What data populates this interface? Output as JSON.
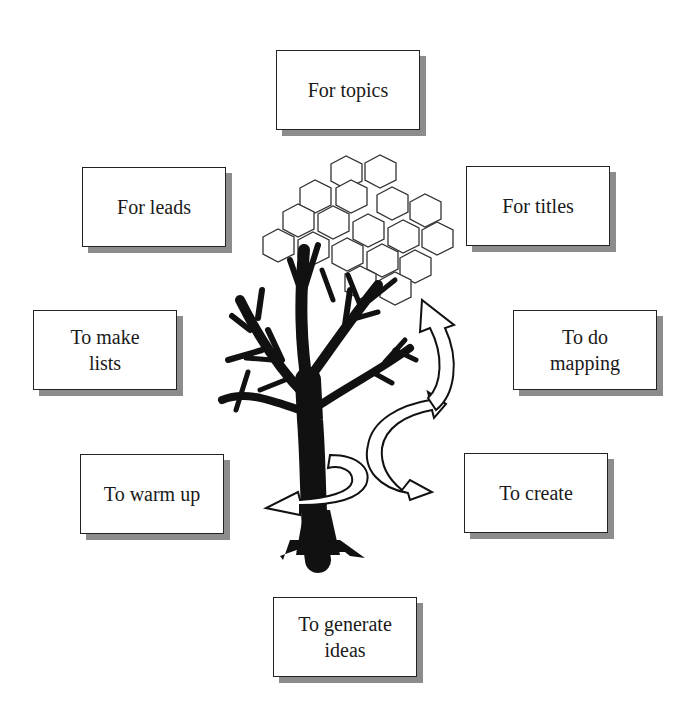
{
  "diagram": {
    "center": "tree-with-honeycomb-and-arrows",
    "boxes": [
      {
        "id": "topics",
        "label": "For topics",
        "x": 276,
        "y": 50
      },
      {
        "id": "leads",
        "label": "For leads",
        "x": 82,
        "y": 167
      },
      {
        "id": "titles",
        "label": "For titles",
        "x": 466,
        "y": 166
      },
      {
        "id": "lists",
        "label": "To make lists",
        "x": 33,
        "y": 310
      },
      {
        "id": "mapping",
        "label": "To do mapping",
        "x": 513,
        "y": 310
      },
      {
        "id": "warmup",
        "label": "To warm up",
        "x": 80,
        "y": 454
      },
      {
        "id": "create",
        "label": "To create",
        "x": 464,
        "y": 453
      },
      {
        "id": "ideas",
        "label": "To generate ideas",
        "x": 273,
        "y": 597
      }
    ],
    "colors": {
      "border": "#222222",
      "shadow": "#8c8c8c",
      "ink": "#111111",
      "background": "#ffffff"
    }
  }
}
